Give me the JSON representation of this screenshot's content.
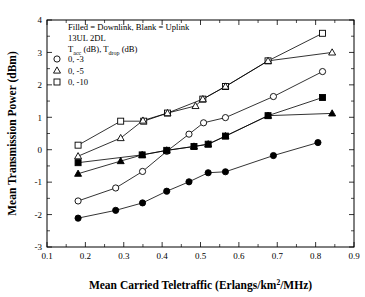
{
  "chart_data": {
    "type": "line",
    "title": "",
    "xlabel": "Mean Carried Teletraffic (Erlangs/km2/MHz)",
    "xlabel_parts": {
      "pre": "Mean Carried Teletraffic (Erlangs/km",
      "sup": "2",
      "post": "/MHz)"
    },
    "ylabel": "Mean Transmission Power (dBm)",
    "xlim": [
      0.1,
      0.9
    ],
    "ylim": [
      -3,
      4
    ],
    "xticks": [
      0.1,
      0.2,
      0.3,
      0.4,
      0.5,
      0.6,
      0.7,
      0.8,
      0.9
    ],
    "xtick_labels": [
      "0.1",
      "0.2",
      "0.3",
      "0.4",
      "0.5",
      "0.6",
      "0.7",
      "0.8",
      "0.9"
    ],
    "yticks": [
      -3,
      -2,
      -1,
      0,
      1,
      2,
      3,
      4
    ],
    "ytick_labels": [
      "-3",
      "-2",
      "-1",
      "0",
      "1",
      "2",
      "3",
      "4"
    ],
    "grid": false,
    "legend_position": "upper-left-inside",
    "annotations": [
      "Filled = Downlink, Blank = Uplink",
      "13UL 2DL"
    ],
    "legend_header": {
      "pre1": "T",
      "sub1": "acc",
      "mid": " (dB), T",
      "sub2": "drop",
      "post": " (dB)"
    },
    "legend_entries": [
      {
        "marker": "circle-open",
        "label": "0, -3"
      },
      {
        "marker": "triangle-open",
        "label": "0, -5"
      },
      {
        "marker": "square-open",
        "label": "0, -10"
      }
    ],
    "series": [
      {
        "name": "0, -10 Uplink",
        "marker": "square-open",
        "filled": false,
        "points": [
          [
            0.181,
            0.14
          ],
          [
            0.292,
            0.88
          ],
          [
            0.352,
            0.88
          ],
          [
            0.414,
            1.13
          ],
          [
            0.506,
            1.56
          ],
          [
            0.565,
            1.95
          ],
          [
            0.676,
            2.74
          ],
          [
            0.818,
            3.59
          ]
        ]
      },
      {
        "name": "0, -5 Uplink",
        "marker": "triangle-open",
        "filled": false,
        "points": [
          [
            0.181,
            -0.2
          ],
          [
            0.292,
            0.36
          ],
          [
            0.35,
            0.9
          ],
          [
            0.414,
            1.13
          ],
          [
            0.487,
            1.35
          ],
          [
            0.506,
            1.56
          ],
          [
            0.565,
            1.95
          ],
          [
            0.676,
            2.74
          ],
          [
            0.843,
            3.0
          ]
        ]
      },
      {
        "name": "0, -3 Uplink",
        "marker": "circle-open",
        "filled": false,
        "points": [
          [
            0.181,
            -1.58
          ],
          [
            0.279,
            -1.18
          ],
          [
            0.349,
            -0.67
          ],
          [
            0.412,
            -0.05
          ],
          [
            0.47,
            0.48
          ],
          [
            0.508,
            0.83
          ],
          [
            0.565,
            0.99
          ],
          [
            0.69,
            1.64
          ],
          [
            0.818,
            2.41
          ]
        ]
      },
      {
        "name": "0, -10 Downlink",
        "marker": "square-filled",
        "filled": true,
        "points": [
          [
            0.181,
            -0.4
          ],
          [
            0.348,
            -0.16
          ],
          [
            0.412,
            -0.02
          ],
          [
            0.483,
            0.1
          ],
          [
            0.52,
            0.17
          ],
          [
            0.565,
            0.42
          ],
          [
            0.676,
            1.05
          ],
          [
            0.818,
            1.61
          ]
        ]
      },
      {
        "name": "0, -5 Downlink",
        "marker": "triangle-filled",
        "filled": true,
        "points": [
          [
            0.181,
            -0.74
          ],
          [
            0.292,
            -0.35
          ],
          [
            0.348,
            -0.16
          ],
          [
            0.412,
            -0.02
          ],
          [
            0.483,
            0.1
          ],
          [
            0.52,
            0.17
          ],
          [
            0.565,
            0.42
          ],
          [
            0.676,
            1.05
          ],
          [
            0.843,
            1.12
          ]
        ]
      },
      {
        "name": "0, -3 Downlink",
        "marker": "circle-filled",
        "filled": true,
        "points": [
          [
            0.181,
            -2.11
          ],
          [
            0.279,
            -1.87
          ],
          [
            0.349,
            -1.64
          ],
          [
            0.412,
            -1.28
          ],
          [
            0.47,
            -0.99
          ],
          [
            0.52,
            -0.71
          ],
          [
            0.565,
            -0.68
          ],
          [
            0.69,
            -0.18
          ],
          [
            0.806,
            0.22
          ]
        ]
      }
    ]
  }
}
